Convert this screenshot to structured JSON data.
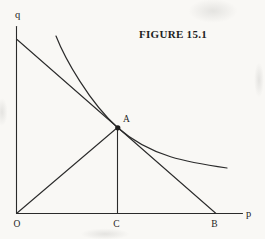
{
  "figure": {
    "title": "FIGURE 15.1",
    "axes": {
      "vertical_label": "q",
      "horizontal_label": "p"
    },
    "points": {
      "origin_label": "O",
      "tangency_label": "A",
      "intercept_label": "B",
      "foot_label": "C"
    },
    "colors": {
      "ink": "#2b2b2b",
      "paper": "#f9f8f5"
    }
  }
}
